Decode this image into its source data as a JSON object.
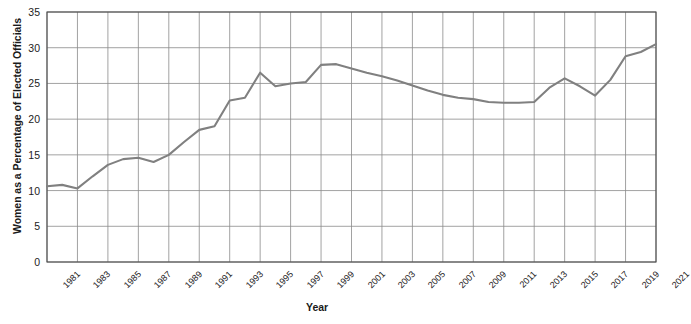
{
  "chart_data": {
    "type": "line",
    "title": "",
    "xlabel": "Year",
    "ylabel": "Women as a Percentage of Elected Officials",
    "ylim": [
      0,
      35
    ],
    "ytick_labels": [
      "0",
      "5",
      "10",
      "15",
      "20",
      "25",
      "30",
      "35"
    ],
    "ytick_values": [
      0,
      5,
      10,
      15,
      20,
      25,
      30,
      35
    ],
    "xlim": [
      1981,
      2021
    ],
    "xtick_labels": [
      "1981",
      "1983",
      "1985",
      "1987",
      "1989",
      "1991",
      "1993",
      "1995",
      "1997",
      "1999",
      "2001",
      "2003",
      "2005",
      "2007",
      "2009",
      "2011",
      "2013",
      "2015",
      "2017",
      "2019",
      "2021"
    ],
    "xtick_values": [
      1981,
      1983,
      1985,
      1987,
      1989,
      1991,
      1993,
      1995,
      1997,
      1999,
      2001,
      2003,
      2005,
      2007,
      2009,
      2011,
      2013,
      2015,
      2017,
      2019,
      2021
    ],
    "grid": true,
    "legend": "none",
    "series": [
      {
        "name": "Women as a Percentage of Elected Officials",
        "color": "#808080",
        "x": [
          1981,
          1982,
          1983,
          1984,
          1985,
          1986,
          1987,
          1988,
          1989,
          1990,
          1991,
          1992,
          1993,
          1994,
          1995,
          1996,
          1997,
          1998,
          1999,
          2000,
          2001,
          2002,
          2003,
          2004,
          2005,
          2006,
          2007,
          2008,
          2009,
          2010,
          2011,
          2012,
          2013,
          2014,
          2015,
          2016,
          2017,
          2018,
          2019,
          2020,
          2021
        ],
        "values": [
          10.6,
          10.8,
          10.3,
          12.0,
          13.6,
          14.4,
          14.6,
          14.0,
          15.0,
          16.8,
          18.5,
          19.0,
          22.6,
          23.0,
          26.5,
          24.6,
          25.0,
          25.2,
          27.6,
          27.7,
          27.1,
          26.5,
          26.0,
          25.4,
          24.7,
          24.0,
          23.4,
          23.0,
          22.8,
          22.4,
          22.3,
          22.3,
          22.4,
          24.4,
          25.7,
          24.6,
          23.3,
          25.5,
          28.8,
          29.4,
          30.5
        ]
      }
    ]
  },
  "axis": {
    "x_title": "Year",
    "y_title": "Women as a Percentage of Elected Officials"
  },
  "colors": {
    "line": "#808080",
    "grid": "#8a8a8a",
    "axis": "#4d4d4d",
    "text": "#1a1a1a",
    "background": "#ffffff"
  }
}
